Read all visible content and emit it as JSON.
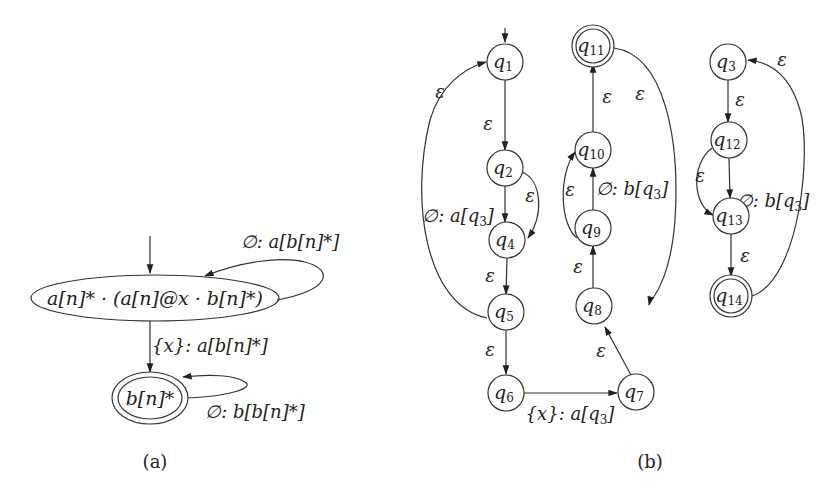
{
  "panel_a": {
    "caption": "(a)",
    "states": [
      {
        "id": "s0",
        "label": "a[n]* · (a[n]@x · b[n]*)",
        "initial": true,
        "accepting": false
      },
      {
        "id": "s1",
        "label": "b[n]*",
        "initial": false,
        "accepting": true
      }
    ],
    "transitions": [
      {
        "from": "s0",
        "to": "s0",
        "label": "∅: a[b[n]*]"
      },
      {
        "from": "s0",
        "to": "s1",
        "label": "{x}: a[b[n]*]"
      },
      {
        "from": "s1",
        "to": "s1",
        "label": "∅: b[b[n]*]"
      }
    ]
  },
  "panel_b": {
    "caption": "(b)",
    "states": [
      {
        "id": "q1",
        "name": "q",
        "sub": "1",
        "initial": true,
        "accepting": false
      },
      {
        "id": "q2",
        "name": "q",
        "sub": "2",
        "accepting": false
      },
      {
        "id": "q4",
        "name": "q",
        "sub": "4",
        "accepting": false
      },
      {
        "id": "q5",
        "name": "q",
        "sub": "5",
        "accepting": false
      },
      {
        "id": "q6",
        "name": "q",
        "sub": "6",
        "accepting": false
      },
      {
        "id": "q7",
        "name": "q",
        "sub": "7",
        "accepting": false
      },
      {
        "id": "q8",
        "name": "q",
        "sub": "8",
        "accepting": false
      },
      {
        "id": "q9",
        "name": "q",
        "sub": "9",
        "accepting": false
      },
      {
        "id": "q10",
        "name": "q",
        "sub": "10",
        "accepting": false
      },
      {
        "id": "q11",
        "name": "q",
        "sub": "11",
        "accepting": true
      },
      {
        "id": "q3",
        "name": "q",
        "sub": "3",
        "accepting": false
      },
      {
        "id": "q12",
        "name": "q",
        "sub": "12",
        "accepting": false
      },
      {
        "id": "q13",
        "name": "q",
        "sub": "13",
        "accepting": false
      },
      {
        "id": "q14",
        "name": "q",
        "sub": "14",
        "accepting": true
      }
    ],
    "transitions": [
      {
        "from": "q1",
        "to": "q2",
        "label": "ε"
      },
      {
        "from": "q2",
        "to": "q4",
        "label_prefix": "∅: a[q",
        "label_sub": "3",
        "label_suffix": "]"
      },
      {
        "from": "q2",
        "to": "q4",
        "label": "ε"
      },
      {
        "from": "q4",
        "to": "q5",
        "label": "ε"
      },
      {
        "from": "q5",
        "to": "q1",
        "label": "ε"
      },
      {
        "from": "q5",
        "to": "q6",
        "label": "ε"
      },
      {
        "from": "q6",
        "to": "q7",
        "label_prefix": "{x}: a[q",
        "label_sub": "3",
        "label_suffix": "]"
      },
      {
        "from": "q7",
        "to": "q8",
        "label": "ε"
      },
      {
        "from": "q8",
        "to": "q9",
        "label": "ε"
      },
      {
        "from": "q9",
        "to": "q10",
        "label_prefix": "∅: b[q",
        "label_sub": "3",
        "label_suffix": "]"
      },
      {
        "from": "q9",
        "to": "q10",
        "label": "ε"
      },
      {
        "from": "q10",
        "to": "q11",
        "label": "ε"
      },
      {
        "from": "q11",
        "to": "q8",
        "label": "ε"
      },
      {
        "from": "q3",
        "to": "q12",
        "label": "ε"
      },
      {
        "from": "q12",
        "to": "q13",
        "label_prefix": "∅: b[q",
        "label_sub": "3",
        "label_suffix": "]"
      },
      {
        "from": "q12",
        "to": "q13",
        "label": "ε"
      },
      {
        "from": "q13",
        "to": "q14",
        "label": "ε"
      },
      {
        "from": "q14",
        "to": "q3",
        "label": "ε"
      }
    ]
  }
}
